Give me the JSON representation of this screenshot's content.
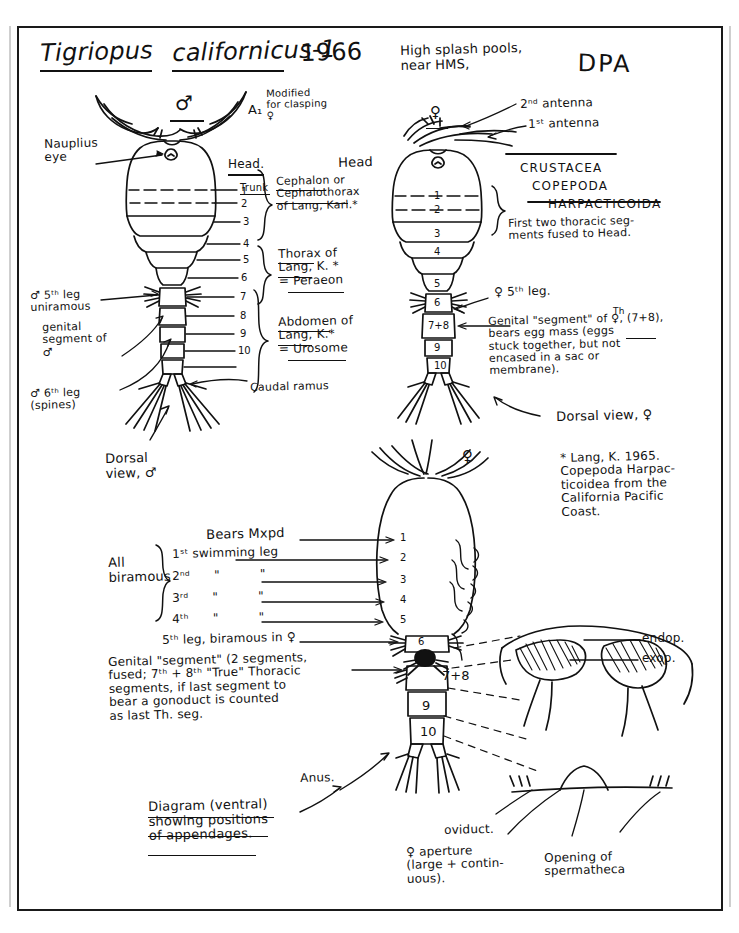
{
  "page": {
    "title": "Tigriopus californicus-1 1966",
    "title_genus": "Tigriopus",
    "title_species": "californicus-1",
    "title_year": "1966",
    "locality": "High splash pools,\nnear HMS,",
    "initials": "DPA"
  },
  "taxonomy": {
    "class": "CRUSTACEA",
    "subclass": "COPEPODA",
    "order": "HARPACTICOIDA"
  },
  "male_figure": {
    "sex_symbol": "♂",
    "antenna_label": "A₁",
    "antenna_note": "Modified\nfor clasping\n♀",
    "nauplius_eye": "Nauplius\neye",
    "head_label": "Head.",
    "trunk_label": "Trunk",
    "segment_numbers": [
      "1",
      "2",
      "3",
      "4",
      "5",
      "6",
      "7",
      "8",
      "9",
      "10"
    ],
    "fifth_leg": "♂ 5ᵗʰ leg\nuniramous",
    "genital_segment": "genital\nsegment of\n♂",
    "sixth_leg": "♂ 6ᵗʰ leg\n(spines)",
    "caudal_ramus": "Caudal ramus",
    "view_caption": "Dorsal\nview, ♂"
  },
  "brackets": {
    "cephalon": "Cephalon or\nCephalothorax\nof Lang, Karl.*",
    "thorax": "Thorax of\nLang, K. *\n= Peraeon",
    "abdomen": "Abdomen of\nLang, K.*\n= Urosome"
  },
  "female_figure": {
    "sex_symbol": "♀",
    "second_antenna": "2ⁿᵈ antenna",
    "first_antenna": "1ˢᵗ antenna",
    "head_label": "Head",
    "segment_numbers": [
      "1",
      "2",
      "3",
      "4",
      "5",
      "6",
      "7+8",
      "9",
      "10"
    ],
    "fused_note": "First two thoracic seg-\nments fused to Head.",
    "fifth_leg": "♀ 5ᵗʰ leg.",
    "genital_note": "Genital \"segment\" of ♀, (7+8),\nbears egg mass (eggs\nstuck together, but not\nencased in a sac or\nmembrane).",
    "genital_note_superscript": "Th",
    "view_caption": "Dorsal view, ♀"
  },
  "footnote": {
    "text": "* Lang, K. 1965.\nCopepoda Harpac-\nticoidea from the\nCalifornia Pacific\nCoast."
  },
  "ventral_figure": {
    "sex_symbol": "♀",
    "bears_mxpd": "Bears Mxpd",
    "all_biramous": "All\nbiramous",
    "legs": [
      "1ˢᵗ swimming leg",
      "2ⁿᵈ      \"          \"",
      "3ʳᵈ      \"          \"",
      "4ᵗʰ      \"          \""
    ],
    "fifth_leg": "5ᵗʰ leg, biramous in ♀",
    "segment_numbers": [
      "1",
      "2",
      "3",
      "4",
      "5",
      "6",
      "7+8",
      "9",
      "10"
    ],
    "genital_note": "Genital \"segment\" (2 segments,\nfused; 7ᵗʰ + 8ᵗʰ \"True\" Thoracic\nsegments, if last segment to\nbear a gonoduct is counted\nas last Th. seg.",
    "anus": "Anus.",
    "caption": "Diagram (ventral)\nshowing positions\nof appendages."
  },
  "detail_figure": {
    "endopod": "endop.",
    "exopod": "exop.",
    "oviduct": "oviduct.",
    "female_aperture": "♀ aperture\n(large + contin-\nuous).",
    "spermatheca": "Opening of\nspermatheca"
  }
}
